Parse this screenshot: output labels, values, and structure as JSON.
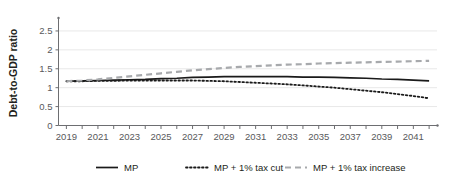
{
  "chart_data": {
    "type": "line",
    "title": "",
    "xlabel": "",
    "ylabel": "Debt-to-GDP ratio",
    "xlim": [
      2018.5,
      2042.5
    ],
    "ylim": [
      0,
      2.75
    ],
    "yticks": [
      "0",
      "0.5",
      "1",
      "1.5",
      "2",
      "2.5"
    ],
    "ytick_values": [
      0,
      0.5,
      1,
      1.5,
      2,
      2.5
    ],
    "grid": true,
    "legend_position": "bottom",
    "x": [
      2019,
      2020,
      2021,
      2022,
      2023,
      2024,
      2025,
      2026,
      2027,
      2028,
      2029,
      2030,
      2031,
      2032,
      2033,
      2034,
      2035,
      2036,
      2037,
      2038,
      2039,
      2040,
      2041,
      2042
    ],
    "xtick_labels": [
      "2019",
      "2021",
      "2023",
      "2025",
      "2027",
      "2029",
      "2031",
      "2033",
      "2035",
      "2037",
      "2039",
      "2041"
    ],
    "xtick_label_values": [
      2019,
      2021,
      2023,
      2025,
      2027,
      2029,
      2031,
      2033,
      2035,
      2037,
      2039,
      2041
    ],
    "series": [
      {
        "name": "MP",
        "style": "solid",
        "color": "#1a1a1a",
        "values": [
          1.17,
          1.18,
          1.19,
          1.2,
          1.21,
          1.22,
          1.24,
          1.25,
          1.27,
          1.28,
          1.29,
          1.29,
          1.29,
          1.29,
          1.29,
          1.28,
          1.28,
          1.27,
          1.26,
          1.25,
          1.23,
          1.22,
          1.2,
          1.18
        ]
      },
      {
        "name": "MP + 1% tax cut",
        "style": "dotted",
        "color": "#1a1a1a",
        "values": [
          1.17,
          1.17,
          1.18,
          1.18,
          1.19,
          1.19,
          1.19,
          1.19,
          1.19,
          1.18,
          1.17,
          1.15,
          1.13,
          1.11,
          1.09,
          1.06,
          1.03,
          1.0,
          0.96,
          0.92,
          0.88,
          0.83,
          0.78,
          0.72
        ]
      },
      {
        "name": "MP + 1% tax increase",
        "style": "dashed",
        "color": "#a7a9ac",
        "values": [
          1.17,
          1.19,
          1.22,
          1.26,
          1.3,
          1.34,
          1.38,
          1.42,
          1.46,
          1.49,
          1.52,
          1.55,
          1.57,
          1.59,
          1.61,
          1.62,
          1.64,
          1.65,
          1.66,
          1.67,
          1.68,
          1.69,
          1.7,
          1.71
        ]
      }
    ]
  },
  "legend": {
    "items": [
      {
        "label": "MP",
        "style": "solid"
      },
      {
        "label": "MP + 1% tax cut",
        "style": "dotted"
      },
      {
        "label": "MP + 1% tax increase",
        "style": "dashed"
      }
    ]
  }
}
